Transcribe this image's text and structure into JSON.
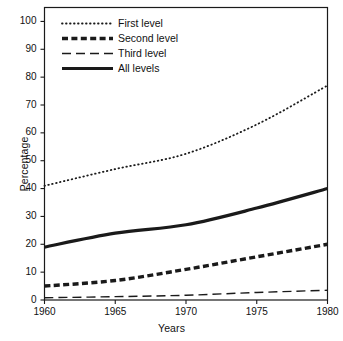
{
  "chart_data": {
    "type": "line",
    "title": "",
    "xlabel": "Years",
    "ylabel": "Percentage",
    "x": [
      1960,
      1965,
      1970,
      1975,
      1980
    ],
    "xtick_labels": [
      "1960",
      "1965",
      "1970",
      "1975",
      "1980"
    ],
    "ytick_labels": [
      "0",
      "10",
      "20",
      "30",
      "40",
      "50",
      "60",
      "70",
      "80",
      "90",
      "100"
    ],
    "yticks": [
      0,
      10,
      20,
      30,
      40,
      50,
      60,
      70,
      80,
      90,
      100
    ],
    "xlim": [
      1960,
      1980
    ],
    "ylim": [
      0,
      105
    ],
    "grid": false,
    "legend_position": "top-left inside axes",
    "series": [
      {
        "name": "First level",
        "style": "dotted",
        "color": "#1a1a1a",
        "values": [
          41,
          47,
          52.5,
          63,
          77
        ]
      },
      {
        "name": "Second level",
        "style": "thick-dashed",
        "color": "#1a1a1a",
        "values": [
          5,
          7,
          11,
          15.5,
          20
        ]
      },
      {
        "name": "Third level",
        "style": "long-dashed-thin",
        "color": "#1a1a1a",
        "values": [
          0.8,
          1.2,
          1.7,
          2.7,
          3.5
        ]
      },
      {
        "name": "All levels",
        "style": "thick-solid",
        "color": "#1a1a1a",
        "values": [
          19,
          24,
          27,
          33,
          40
        ]
      }
    ]
  },
  "legend": {
    "items": [
      {
        "label": "First level"
      },
      {
        "label": "Second level"
      },
      {
        "label": "Third level"
      },
      {
        "label": "All levels"
      }
    ]
  }
}
